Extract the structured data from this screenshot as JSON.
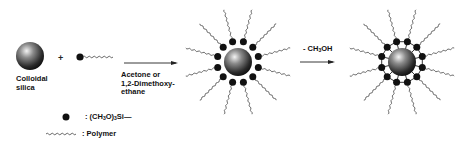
{
  "diagram": {
    "reactant_label_line1": "Colloidal",
    "reactant_label_line2": "silica",
    "plus_sign": "+",
    "step1_condition_line1": "Acetone or",
    "step1_condition_line2": "1,2-Dimethoxy-",
    "step1_condition_line3": "ethane",
    "step2_condition_prefix": "- CH",
    "step2_condition_sub": "3",
    "step2_condition_suffix": "OH",
    "legend": {
      "dot_label_prefix": ": (CH",
      "dot_label_sub1": "3",
      "dot_label_mid": "O)",
      "dot_label_sub2": "3",
      "dot_label_suffix": "Si—",
      "wave_label": ": Polymer"
    },
    "colors": {
      "ink": "#111111",
      "sphere_highlight": "#f0f0f0",
      "sphere_dark": "#1a1a1a",
      "chain": "#444444"
    }
  }
}
